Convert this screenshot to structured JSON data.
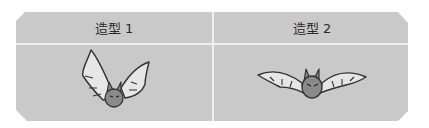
{
  "costumes": [
    {
      "label": "造型 1",
      "icon": "bat-wings-up-icon"
    },
    {
      "label": "造型 2",
      "icon": "bat-wings-spread-icon"
    }
  ],
  "colors": {
    "panel": "#c9c9c9",
    "divider": "#efefef",
    "bat_body": "#8a8a8a",
    "bat_wing": "#e6e6e6",
    "outline": "#333333"
  }
}
